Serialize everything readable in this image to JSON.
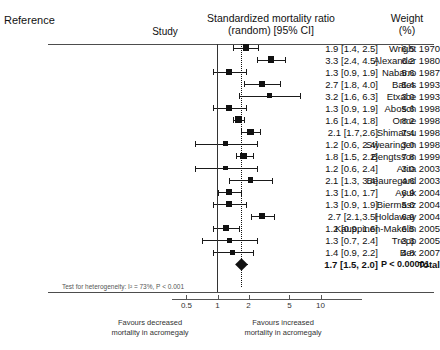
{
  "header": {
    "reference_label": "Reference",
    "study_label": "Study",
    "smr_title_line1": "Standardized mortality ratio",
    "smr_title_line2": "(random) [95% CI]",
    "weight_line1": "Weight",
    "weight_line2": "(%)"
  },
  "footer": {
    "heterogeneity": "Test for heterogeneity: I² = 73%, P < 0.001",
    "favours_left_line1": "Favours decreased",
    "favours_left_line2": "mortality in acromegaly",
    "favours_right_line1": "Favours increased",
    "favours_right_line2": "mortality in acromegaly"
  },
  "chart_data": {
    "type": "forest",
    "title": "Standardized mortality ratio (random) [95% CI]",
    "xlabel": "Standardized mortality ratio",
    "xscale": "log",
    "xticks": [
      0.5,
      1,
      2,
      5,
      10
    ],
    "xtick_labels": [
      "0.5",
      "1",
      "2",
      "5",
      "10"
    ],
    "xlim": [
      0.42,
      12
    ],
    "null_line": 1,
    "pooled_line": 1.7,
    "columns": [
      "Study",
      "Standardized mortality ratio (random) [95% CI]",
      "Weight (%)"
    ],
    "rows": [
      {
        "study": "Wright 1970",
        "estimate": 1.9,
        "ci_low": 1.4,
        "ci_high": 2.5,
        "value_text": "1.9 [1.4, 2.5]",
        "weight": 6.5,
        "weight_text": "6.5"
      },
      {
        "study": "Alexander 1980",
        "estimate": 3.3,
        "ci_low": 2.4,
        "ci_high": 4.5,
        "value_text": "3.3 [2.4, 4.5]",
        "weight": 6.2,
        "weight_text": "6.2"
      },
      {
        "study": "Nabarro 1987",
        "estimate": 1.3,
        "ci_low": 0.9,
        "ci_high": 1.9,
        "value_text": "1.3 [0.9, 1.9]",
        "weight": 5.6,
        "weight_text": "5.6"
      },
      {
        "study": "Bates 1993",
        "estimate": 2.7,
        "ci_low": 1.8,
        "ci_high": 4.0,
        "value_text": "2.7 [1.8, 4.0]",
        "weight": 5.4,
        "weight_text": "5.4"
      },
      {
        "study": "Etxabe 1993",
        "estimate": 3.2,
        "ci_low": 1.6,
        "ci_high": 6.3,
        "value_text": "3.2 [1.6, 6.3]",
        "weight": 3.0,
        "weight_text": "3.0"
      },
      {
        "study": "Abosch 1998",
        "estimate": 1.3,
        "ci_low": 0.9,
        "ci_high": 1.9,
        "value_text": "1.3 [0.9, 1.9]",
        "weight": 5.6,
        "weight_text": "5.6"
      },
      {
        "study": "Orme 1998",
        "estimate": 1.6,
        "ci_low": 1.4,
        "ci_high": 1.8,
        "value_text": "1.6 [1.4, 1.8]",
        "weight": 8.2,
        "weight_text": "8.2"
      },
      {
        "study": "Shimatsu 1998",
        "estimate": 2.1,
        "ci_low": 1.7,
        "ci_high": 2.6,
        "value_text": "2.1 [1.7,2.6]",
        "weight": 7.4,
        "weight_text": "7.4"
      },
      {
        "study": "Swearingen 1998",
        "estimate": 1.2,
        "ci_low": 0.6,
        "ci_high": 2.4,
        "value_text": "1.2 [0.6, 2.4]",
        "weight": 3.0,
        "weight_text": "3.0"
      },
      {
        "study": "Bengtsson 1999",
        "estimate": 1.8,
        "ci_low": 1.5,
        "ci_high": 2.2,
        "value_text": "1.8 [1.5, 2.2]",
        "weight": 7.8,
        "weight_text": "7.8"
      },
      {
        "study": "Arita 2003",
        "estimate": 1.2,
        "ci_low": 0.6,
        "ci_high": 2.4,
        "value_text": "1.2 [0.6, 2.4]",
        "weight": 3.0,
        "weight_text": "3.0"
      },
      {
        "study": "Beauregard 2003",
        "estimate": 2.1,
        "ci_low": 1.3,
        "ci_high": 3.4,
        "value_text": "2.1 [1.3, 3.4]",
        "weight": 4.6,
        "weight_text": "4.6"
      },
      {
        "study": "Ayuk 2004",
        "estimate": 1.3,
        "ci_low": 1.0,
        "ci_high": 1.7,
        "value_text": "1.3 [1.0, 1.7]",
        "weight": 6.9,
        "weight_text": "6.9"
      },
      {
        "study": "Biermasz  2004",
        "estimate": 1.3,
        "ci_low": 0.9,
        "ci_high": 1.9,
        "value_text": "1.3 [0.9, 1.9]",
        "weight": 5.6,
        "weight_text": "5.6"
      },
      {
        "study": "Holdaway 2004",
        "estimate": 2.7,
        "ci_low": 2.1,
        "ci_high": 3.5,
        "value_text": "2.7 [2.1,3.5]",
        "weight": 6.9,
        "weight_text": "6.9"
      },
      {
        "study": "Kauppinen-Makelin 2005",
        "estimate": 1.2,
        "ci_low": 0.9,
        "ci_high": 1.6,
        "value_text": "1.2 [0.9, 1.6]",
        "weight": 6.5,
        "weight_text": "6.5"
      },
      {
        "study": "Trepp 2005",
        "estimate": 1.3,
        "ci_low": 0.7,
        "ci_high": 2.4,
        "value_text": "1.3 [0.7, 2.4]",
        "weight": 3.3,
        "weight_text": "3.3"
      },
      {
        "study": "Bex 2007",
        "estimate": 1.4,
        "ci_low": 0.9,
        "ci_high": 2.2,
        "value_text": "1.4 [0.9, 2.2]",
        "weight": 4.8,
        "weight_text": "4.8"
      }
    ],
    "total": {
      "study": "Total",
      "estimate": 1.7,
      "ci_low": 1.5,
      "ci_high": 2.0,
      "value_text": "1.7 [1.5, 2.0]",
      "weight_text": "P < 0.00001"
    }
  }
}
